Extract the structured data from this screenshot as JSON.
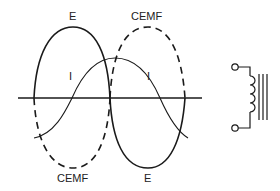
{
  "diagram": {
    "labels": {
      "e_top": "E",
      "e_bottom": "E",
      "cemf_top": "CEMF",
      "cemf_bottom": "CEMF",
      "i_left": "I",
      "i_right": "I"
    },
    "colors": {
      "stroke": "#1a1a1a",
      "background": "#ffffff"
    },
    "symbol": "inductor-iron-core"
  }
}
